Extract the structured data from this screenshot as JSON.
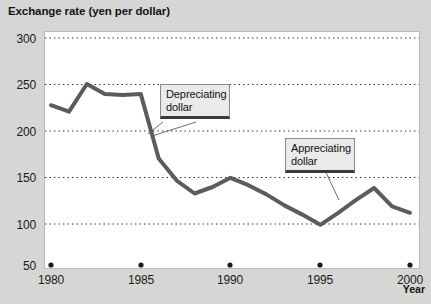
{
  "chart_data": {
    "type": "line",
    "title": "Exchange rate (yen per dollar)",
    "xlabel": "Year",
    "ylabel": "Exchange rate (yen per dollar)",
    "ylim": [
      50,
      300
    ],
    "xlim": [
      1980,
      2000
    ],
    "grid": true,
    "grid_style": "dotted-horizontal",
    "legend": "none",
    "yticks": [
      300,
      250,
      200,
      150,
      100,
      50
    ],
    "xticks": [
      1980,
      1985,
      1990,
      1995,
      2000
    ],
    "x": [
      1980,
      1981,
      1982,
      1983,
      1984,
      1985,
      1986,
      1987,
      1988,
      1989,
      1990,
      1991,
      1992,
      1993,
      1994,
      1995,
      1996,
      1997,
      1998,
      1999,
      2000
    ],
    "values": [
      227,
      220,
      250,
      239,
      238,
      239,
      169,
      145,
      131,
      138,
      148,
      140,
      130,
      118,
      108,
      97,
      110,
      124,
      137,
      117,
      110
    ],
    "series": [
      {
        "name": "Exchange rate (yen per dollar)",
        "color": "#5c5c5c",
        "values": [
          227,
          220,
          250,
          239,
          238,
          239,
          169,
          145,
          131,
          138,
          148,
          140,
          130,
          118,
          108,
          97,
          110,
          124,
          137,
          117,
          110
        ]
      }
    ],
    "annotations": [
      {
        "id": "depreciating",
        "line1": "Depreciating",
        "line2": "dollar",
        "points_to_year": 1986,
        "points_to_value": 193
      },
      {
        "id": "appreciating",
        "line1": "Appreciating",
        "line2": "dollar",
        "points_to_year": 1996,
        "points_to_value": 112
      }
    ],
    "axis_markers": {
      "description": "round dots on baseline at each labeled year",
      "years": [
        1980,
        1985,
        1990,
        1995,
        2000
      ],
      "value": 50
    }
  },
  "colors": {
    "page_background": "#d6d6d4",
    "plot_background": "#ffffff",
    "line": "#5c5c5c",
    "grid": "#2b2b2b",
    "text": "#141414",
    "annotation_fill": "#eaeaea",
    "annotation_border": "#8a8a8a",
    "annotation_underline": "#3a3a3a"
  },
  "ytick_labels": [
    "300",
    "250",
    "200",
    "150",
    "100",
    "50"
  ],
  "xtick_labels": [
    "1980",
    "1985",
    "1990",
    "1995",
    "2000"
  ]
}
